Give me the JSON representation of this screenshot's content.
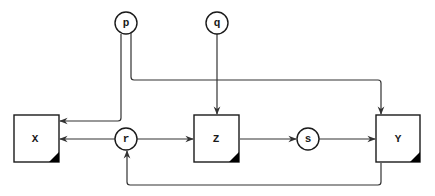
{
  "diagram": {
    "type": "causal-graph",
    "colors": {
      "stroke": "#1a1a1a",
      "edge": "#333333",
      "fill": "#ffffff",
      "corner": "#000000"
    },
    "nodes": {
      "p": {
        "label": "p",
        "shape": "circle"
      },
      "q": {
        "label": "q",
        "shape": "circle"
      },
      "r": {
        "label": "r",
        "shape": "circle"
      },
      "s": {
        "label": "s",
        "shape": "circle"
      },
      "X": {
        "label": "X",
        "shape": "box"
      },
      "Z": {
        "label": "Z",
        "shape": "box"
      },
      "Y": {
        "label": "Y",
        "shape": "box"
      }
    },
    "edges": [
      {
        "from": "p",
        "to": "X"
      },
      {
        "from": "p",
        "to": "Y"
      },
      {
        "from": "q",
        "to": "Z"
      },
      {
        "from": "r",
        "to": "X"
      },
      {
        "from": "r",
        "to": "Z"
      },
      {
        "from": "Z",
        "to": "s"
      },
      {
        "from": "s",
        "to": "Y"
      },
      {
        "from": "Y",
        "to": "r"
      }
    ]
  }
}
